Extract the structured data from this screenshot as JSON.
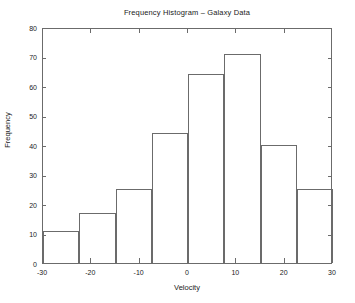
{
  "chart_data": {
    "type": "bar",
    "title": "Frequency Histogram – Galaxy Data",
    "xlabel": "Velocity",
    "ylabel": "Frequency",
    "xlim": [
      -30,
      30
    ],
    "ylim": [
      0,
      80
    ],
    "grid": false,
    "legend": false,
    "bin_edges": [
      -30,
      -22.5,
      -15,
      -7.5,
      0,
      7.5,
      15,
      22.5,
      30
    ],
    "bin_centers": [
      -26.25,
      -18.75,
      -11.25,
      -3.75,
      3.75,
      11.25,
      18.75,
      26.25
    ],
    "values": [
      11,
      17,
      25,
      44,
      64,
      71,
      40,
      25,
      17,
      10
    ],
    "bars": [
      {
        "left": -30,
        "right": -22.5,
        "value": 11
      },
      {
        "left": -22.5,
        "right": -15,
        "value": 17
      },
      {
        "left": -15,
        "right": -7.5,
        "value": 25
      },
      {
        "left": -7.5,
        "right": 0,
        "value": 44
      },
      {
        "left": 0,
        "right": 3.75,
        "value": 64
      },
      {
        "left": 3.75,
        "right": 11.25,
        "value": 71
      },
      {
        "left": 11.25,
        "right": 18.75,
        "value": 40
      },
      {
        "left": 18.75,
        "right": 26.25,
        "value": 25
      },
      {
        "left": 26.25,
        "right": 30,
        "value": 17
      },
      {
        "left": 30,
        "right": 30,
        "value": 10
      }
    ],
    "xticks": [
      -30,
      -20,
      -10,
      0,
      10,
      20,
      30
    ],
    "xtick_labels": [
      "-30",
      "-20",
      "-10",
      "0",
      "10",
      "20",
      "30"
    ],
    "yticks": [
      0,
      10,
      20,
      30,
      40,
      50,
      60,
      70,
      80
    ],
    "ytick_labels": [
      "0",
      "10",
      "20",
      "30",
      "40",
      "50",
      "60",
      "70",
      "80"
    ],
    "colors": {
      "axis": "#6b6b6b",
      "bar_edge": "#6b6b6b",
      "bar_fill": "#ffffff",
      "text": "#1a1a1a",
      "background": "#ffffff"
    }
  }
}
